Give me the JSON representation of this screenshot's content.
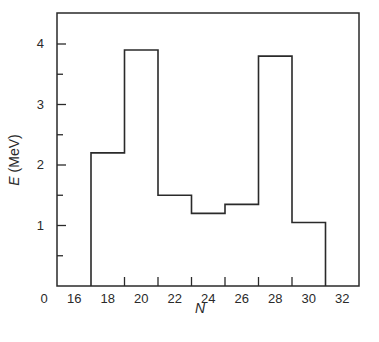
{
  "chart_data": {
    "type": "bar",
    "style": "step-histogram",
    "title": "",
    "xlabel": "N",
    "ylabel": "E (MeV)",
    "ylabel_var": "E",
    "ylabel_unit": "(MeV)",
    "bins": [
      {
        "x_start": 17,
        "x_end": 19,
        "value": 2.2
      },
      {
        "x_start": 19,
        "x_end": 21,
        "value": 3.9
      },
      {
        "x_start": 21,
        "x_end": 23,
        "value": 1.5
      },
      {
        "x_start": 23,
        "x_end": 25,
        "value": 1.2
      },
      {
        "x_start": 25,
        "x_end": 27,
        "value": 1.35
      },
      {
        "x_start": 27,
        "x_end": 29,
        "value": 3.8
      },
      {
        "x_start": 29,
        "x_end": 31,
        "value": 1.05
      }
    ],
    "categories": [
      "17-19",
      "19-21",
      "21-23",
      "23-25",
      "25-27",
      "27-29",
      "29-31"
    ],
    "values": [
      2.2,
      3.9,
      1.5,
      1.2,
      1.35,
      3.8,
      1.05
    ],
    "x_tick_labels": [
      "0",
      "16",
      "18",
      "20",
      "22",
      "24",
      "26",
      "28",
      "30",
      "32"
    ],
    "y_tick_labels": [
      "1",
      "2",
      "3",
      "4"
    ],
    "xlim": [
      15,
      33
    ],
    "ylim": [
      0,
      4.5
    ],
    "y_minor_ticks": [
      0.5,
      1.5,
      2.5,
      3.5
    ],
    "x_ticks_at": [
      19,
      21,
      23,
      25,
      27,
      29
    ],
    "grid": false,
    "legend": null,
    "line_color": "#2a2a2a"
  }
}
